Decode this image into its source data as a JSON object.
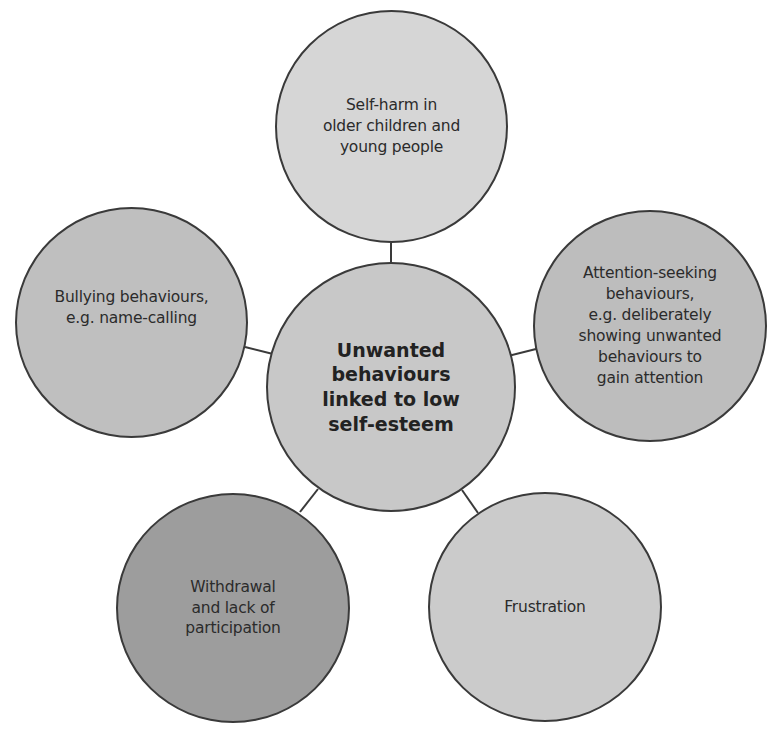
{
  "diagram": {
    "type": "mind-map",
    "center": {
      "label": "Unwanted\nbehaviours\nlinked to low\nself-esteem",
      "fill": "#c8c8c8"
    },
    "nodes": [
      {
        "id": "self-harm",
        "label": "Self-harm in\nolder children and\nyoung people",
        "fill": "#d6d6d6"
      },
      {
        "id": "attention-seeking",
        "label": "Attention-seeking\nbehaviours,\ne.g. deliberately\nshowing unwanted\nbehaviours to\ngain attention",
        "fill": "#bdbdbd"
      },
      {
        "id": "frustration",
        "label": "Frustration",
        "fill": "#cbcbcb"
      },
      {
        "id": "withdrawal",
        "label": "Withdrawal\nand lack of\nparticipation",
        "fill": "#9d9d9d"
      },
      {
        "id": "bullying",
        "label": "Bullying behaviours,\ne.g. name-calling",
        "fill": "#bfbfbf"
      }
    ],
    "line_color": "#3a3a3a"
  }
}
